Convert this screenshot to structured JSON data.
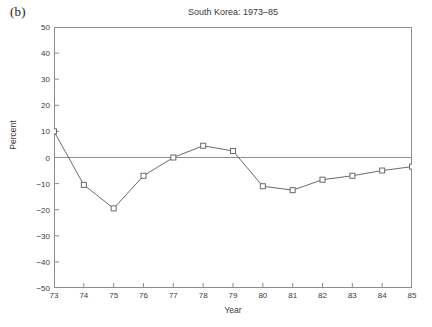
{
  "panel": {
    "label": "(b)"
  },
  "chart_data": {
    "type": "line",
    "title": "South Korea: 1973–85",
    "xlabel": "Year",
    "ylabel": "Percent",
    "x": [
      73,
      74,
      75,
      76,
      77,
      78,
      79,
      80,
      81,
      82,
      83,
      84,
      85
    ],
    "xtick_labels": [
      "73",
      "74",
      "75",
      "76",
      "77",
      "78",
      "79",
      "80",
      "81",
      "82",
      "83",
      "84",
      "85"
    ],
    "values": [
      10,
      -10.5,
      -19.5,
      -7,
      0,
      4.5,
      2.5,
      -11,
      -12.5,
      -8.5,
      -7,
      -5,
      -3.5
    ],
    "ylim": [
      -50,
      50
    ],
    "xlim": [
      73,
      85
    ],
    "yticks": [
      50,
      40,
      30,
      20,
      10,
      0,
      -10,
      -20,
      -30,
      -40,
      -50
    ],
    "ytick_labels": [
      "50",
      "40",
      "30",
      "20",
      "10",
      "0",
      "−10",
      "−20",
      "−30",
      "−40",
      "−50"
    ],
    "grid": false,
    "zero_line": true,
    "legend": null,
    "marker": "open-square",
    "line_color": "#6b6b6b",
    "marker_color": "#6b6b6b",
    "axis_color": "#8d8d8d"
  }
}
